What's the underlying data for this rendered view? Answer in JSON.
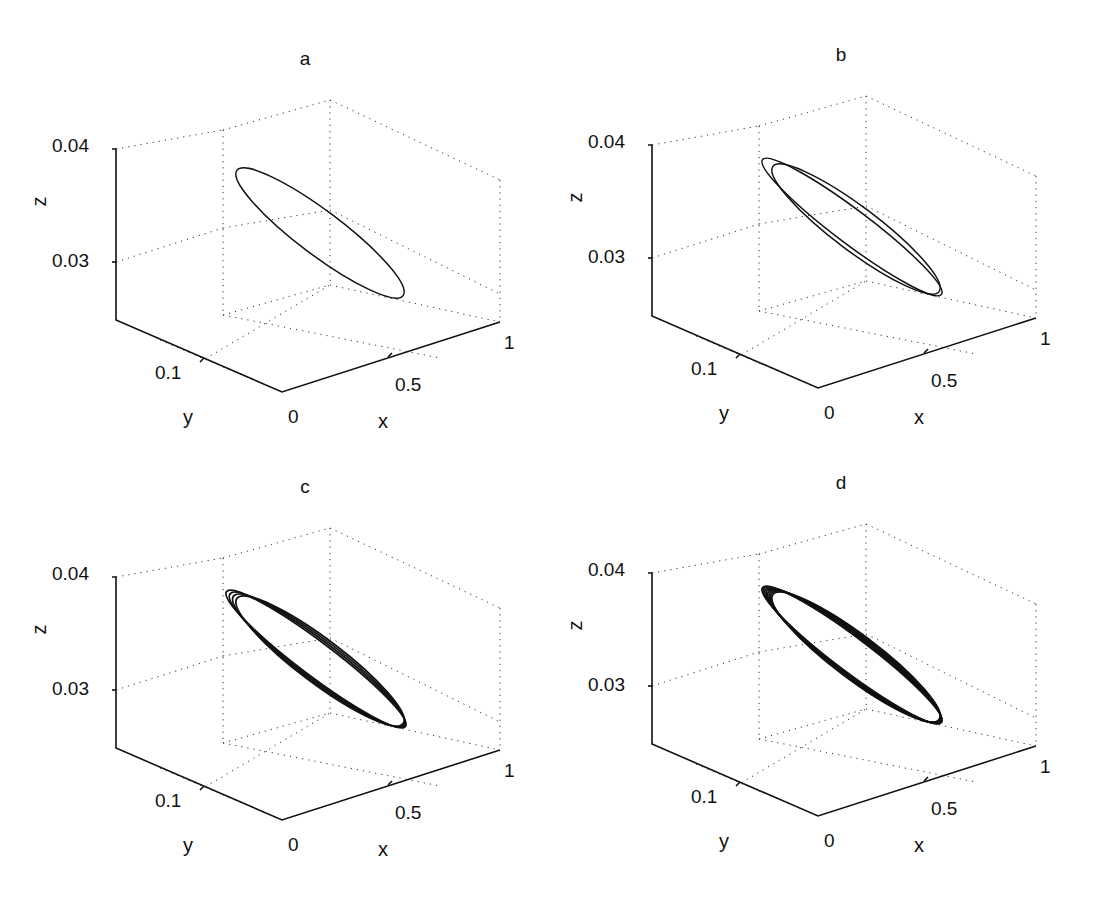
{
  "figure": {
    "panels": [
      {
        "id": "a",
        "title": "a",
        "loops": 1
      },
      {
        "id": "b",
        "title": "b",
        "loops": 2
      },
      {
        "id": "c",
        "title": "c",
        "loops": 4
      },
      {
        "id": "d",
        "title": "d",
        "loops": 8
      }
    ]
  },
  "axes": {
    "x_label": "x",
    "y_label": "y",
    "z_label": "z",
    "x_ticks": [
      "0",
      "0.5",
      "1"
    ],
    "y_ticks": [
      "0.1"
    ],
    "z_ticks": [
      "0.03",
      "0.04"
    ]
  },
  "chart_data": [
    {
      "type": "line",
      "subtype": "3d-phase-portrait",
      "title": "a",
      "xlabel": "x",
      "ylabel": "y",
      "zlabel": "z",
      "x_ticks": [
        0,
        0.5,
        1
      ],
      "y_ticks": [
        0.1
      ],
      "z_ticks": [
        0.03,
        0.04
      ],
      "xlim": [
        0,
        1
      ],
      "ylim": [
        0,
        0.2
      ],
      "zlim": [
        0.025,
        0.04
      ],
      "grid": true,
      "description": "single closed limit cycle (period-1 orbit)",
      "series": [
        {
          "name": "orbit",
          "loops": 1
        }
      ]
    },
    {
      "type": "line",
      "subtype": "3d-phase-portrait",
      "title": "b",
      "xlabel": "x",
      "ylabel": "y",
      "zlabel": "z",
      "x_ticks": [
        0,
        0.5,
        1
      ],
      "y_ticks": [
        0.1
      ],
      "z_ticks": [
        0.03,
        0.04
      ],
      "xlim": [
        0,
        1
      ],
      "ylim": [
        0,
        0.2
      ],
      "zlim": [
        0.025,
        0.04
      ],
      "grid": true,
      "description": "period-2 orbit (two nested loops)",
      "series": [
        {
          "name": "orbit",
          "loops": 2
        }
      ]
    },
    {
      "type": "line",
      "subtype": "3d-phase-portrait",
      "title": "c",
      "xlabel": "x",
      "ylabel": "y",
      "zlabel": "z",
      "x_ticks": [
        0,
        0.5,
        1
      ],
      "y_ticks": [
        0.1
      ],
      "z_ticks": [
        0.03,
        0.04
      ],
      "xlim": [
        0,
        1
      ],
      "ylim": [
        0,
        0.2
      ],
      "zlim": [
        0.025,
        0.04
      ],
      "grid": true,
      "description": "period-4 orbit (four closely spaced loops)",
      "series": [
        {
          "name": "orbit",
          "loops": 4
        }
      ]
    },
    {
      "type": "line",
      "subtype": "3d-phase-portrait",
      "title": "d",
      "xlabel": "x",
      "ylabel": "y",
      "zlabel": "z",
      "x_ticks": [
        0,
        0.5,
        1
      ],
      "y_ticks": [
        0.1
      ],
      "z_ticks": [
        0.03,
        0.04
      ],
      "xlim": [
        0,
        1
      ],
      "ylim": [
        0,
        0.2
      ],
      "zlim": [
        0.025,
        0.04
      ],
      "grid": true,
      "description": "chaotic-like band of many loops",
      "series": [
        {
          "name": "orbit",
          "loops": 8
        }
      ]
    }
  ]
}
